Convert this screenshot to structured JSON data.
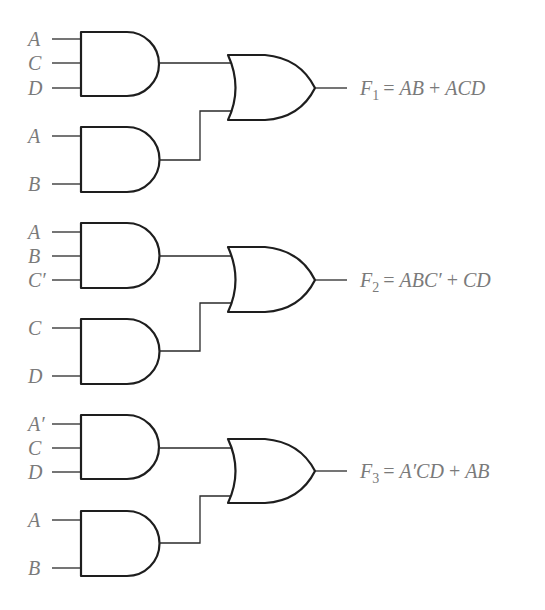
{
  "diagram": {
    "type": "logic-circuit",
    "colors": {
      "line": "#1e1e1e",
      "text": "#7a7a7a",
      "background": "#ffffff"
    },
    "circuits": [
      {
        "id": "F1",
        "output_name": "F",
        "output_sub": "1",
        "expression": "AB + ACD",
        "expression_parts": [
          "= ",
          "AB",
          " + ",
          "ACD"
        ],
        "and_gates": [
          {
            "inputs": [
              "A",
              "C",
              "D"
            ]
          },
          {
            "inputs": [
              "A",
              "B"
            ]
          }
        ],
        "or_gate": {
          "inputs": 2
        }
      },
      {
        "id": "F2",
        "output_name": "F",
        "output_sub": "2",
        "expression": "ABC' + CD",
        "expression_parts": [
          "= ",
          "ABC′",
          " + ",
          "CD"
        ],
        "and_gates": [
          {
            "inputs": [
              "A",
              "B",
              "C′"
            ]
          },
          {
            "inputs": [
              "C",
              "D"
            ]
          }
        ],
        "or_gate": {
          "inputs": 2
        }
      },
      {
        "id": "F3",
        "output_name": "F",
        "output_sub": "3",
        "expression": "A'CD + AB",
        "expression_parts": [
          "= ",
          "A′CD",
          " + ",
          "AB"
        ],
        "and_gates": [
          {
            "inputs": [
              "A′",
              "C",
              "D"
            ]
          },
          {
            "inputs": [
              "A",
              "B"
            ]
          }
        ],
        "or_gate": {
          "inputs": 2
        }
      }
    ]
  }
}
